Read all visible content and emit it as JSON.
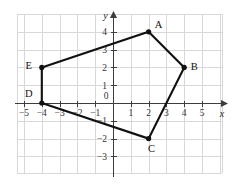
{
  "chart_data": {
    "type": "scatter",
    "title": "",
    "xlabel": "x",
    "ylabel": "y",
    "xlim": [
      -5.4,
      5.6
    ],
    "ylim": [
      -3.5,
      4.6
    ],
    "grid": true,
    "grid_spacing": 1,
    "legend": "none",
    "origin_label": "0",
    "x_ticks": [
      -5,
      -4,
      -3,
      -2,
      -1,
      1,
      2,
      3,
      4,
      5
    ],
    "x_tick_labels": [
      "−5",
      "−4",
      "−3",
      "−2",
      "−1",
      "1",
      "2",
      "3",
      "4",
      "5"
    ],
    "y_ticks": [
      4,
      3,
      2,
      1,
      -1,
      -2,
      -3
    ],
    "y_tick_labels": [
      "4",
      "3",
      "2",
      "1",
      "−1",
      "−2",
      "−3"
    ],
    "shape": "pentagon",
    "closed": true,
    "points": [
      {
        "label": "A",
        "x": 2,
        "y": 4,
        "label_dx": 10,
        "label_dy": -4
      },
      {
        "label": "B",
        "x": 4,
        "y": 2,
        "label_dx": 10,
        "label_dy": 3
      },
      {
        "label": "C",
        "x": 2,
        "y": -2,
        "label_dx": 3,
        "label_dy": 13
      },
      {
        "label": "D",
        "x": -4,
        "y": 0,
        "label_dx": -13,
        "label_dy": -6
      },
      {
        "label": "E",
        "x": -4,
        "y": 2,
        "label_dx": -13,
        "label_dy": 2
      }
    ],
    "vertex_order": [
      "A",
      "B",
      "C",
      "D",
      "E"
    ],
    "colors": {
      "grid": "#d8d8d8",
      "axis": "#3d3d3d",
      "polygon": "#111111",
      "vertex": "#111111",
      "background": "#ffffff",
      "tick_label": "#333333"
    }
  }
}
